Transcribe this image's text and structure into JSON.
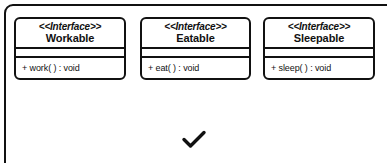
{
  "diagram": {
    "type": "uml-class-diagram",
    "frame": {
      "shape": "rounded-rectangle",
      "border_color": "#111111",
      "background": "#ffffff"
    },
    "interfaces": [
      {
        "stereotype": "<<Interface>>",
        "name": "Workable",
        "attributes": [],
        "operations": [
          "+ work( ) : void"
        ]
      },
      {
        "stereotype": "<<Interface>>",
        "name": "Eatable",
        "attributes": [],
        "operations": [
          "+ eat( ) : void"
        ]
      },
      {
        "stereotype": "<<Interface>>",
        "name": "Sleepable",
        "attributes": [],
        "operations": [
          "+ sleep( ) : void"
        ]
      }
    ],
    "marker": {
      "icon": "check-icon",
      "glyph": "✓",
      "color": "#111111"
    }
  }
}
